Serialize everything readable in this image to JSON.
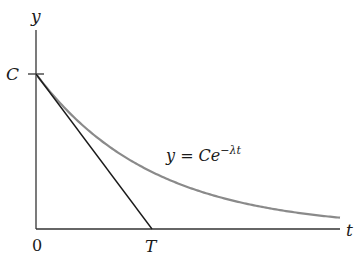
{
  "diagram": {
    "type": "exponential-decay-with-tangent",
    "axes": {
      "x_label": "t",
      "y_label": "y",
      "origin_label": "0"
    },
    "marks": {
      "y_intercept_label": "C",
      "tangent_x_intercept_label": "T"
    },
    "curve": {
      "equation_label_prefix": "y = Ce",
      "equation_label_exponent": "−λt",
      "color": "#8a8a8a"
    },
    "tangent_line": {
      "color": "#1a1a1a"
    },
    "axis_color": "#333333"
  }
}
